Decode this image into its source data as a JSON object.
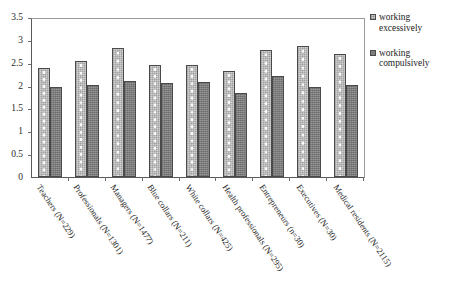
{
  "chart_data": {
    "type": "bar",
    "title": "",
    "xlabel": "",
    "ylabel": "",
    "ylim": [
      0,
      3.5
    ],
    "yticks": [
      "0",
      "0.5",
      "1",
      "1.5",
      "2",
      "2.5",
      "3",
      "3.5"
    ],
    "ytick_values": [
      0,
      0.5,
      1,
      1.5,
      2,
      2.5,
      3,
      3.5
    ],
    "grid": false,
    "legend_position": "right",
    "categories": [
      "Teachers (N=229)",
      "Professionals (N=1301)",
      "Managers (N=1477)",
      "Blue collars (N=211)",
      "White collars (N=425)",
      "Health professionals (N=295)",
      "Entrepreneurs (n=30)",
      "Executives (N=30)",
      "Medical residents (N=2115)"
    ],
    "series": [
      {
        "name": "working\nexcessively",
        "values": [
          2.39,
          2.54,
          2.82,
          2.44,
          2.45,
          2.33,
          2.77,
          2.86,
          2.69
        ]
      },
      {
        "name": "working\ncompulsively",
        "values": [
          1.96,
          2.02,
          2.1,
          2.06,
          2.07,
          1.83,
          2.2,
          1.98,
          2.02
        ]
      }
    ]
  },
  "legend": {
    "items": [
      {
        "label": "working\nexcessively",
        "color": "#d2d2d2"
      },
      {
        "label": "working\ncompulsively",
        "color": "#7d7d7d"
      }
    ]
  }
}
